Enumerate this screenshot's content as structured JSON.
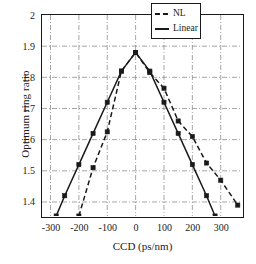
{
  "chart_data": {
    "type": "line",
    "title": "",
    "xlabel": "CCD (ps/nm)",
    "ylabel": "Optimum ring ratio",
    "xlim": [
      -330,
      375
    ],
    "ylim": [
      1.355,
      2.0
    ],
    "xticks": [
      -300,
      -200,
      -100,
      0,
      100,
      200,
      300
    ],
    "xticklabels": [
      "-300",
      "-200",
      "-100",
      "0",
      "100",
      "200",
      "300"
    ],
    "yticks": [
      1.4,
      1.5,
      1.6,
      1.7,
      1.8,
      1.9,
      2.0
    ],
    "yticklabels": [
      "1.4",
      "1.5",
      "1.6",
      "1.7",
      "1.8",
      "1.9",
      "2"
    ],
    "grid": true,
    "legend_position": "upper right",
    "series": [
      {
        "name": "NL",
        "style": "dashed",
        "marker": "square",
        "color": "#1a1a1a",
        "x": [
          -200,
          -150,
          -100,
          -50,
          0,
          50,
          100,
          150,
          200,
          250,
          300,
          360
        ],
        "y": [
          1.355,
          1.51,
          1.625,
          1.82,
          1.88,
          1.815,
          1.765,
          1.66,
          1.61,
          1.525,
          1.47,
          1.39
        ]
      },
      {
        "name": "Linear",
        "style": "solid",
        "marker": "square",
        "color": "#1a1a1a",
        "x": [
          -280,
          -250,
          -200,
          -150,
          -100,
          -50,
          0,
          50,
          100,
          150,
          200,
          250,
          280
        ],
        "y": [
          1.355,
          1.42,
          1.52,
          1.62,
          1.72,
          1.82,
          1.88,
          1.82,
          1.72,
          1.62,
          1.52,
          1.42,
          1.355
        ]
      }
    ]
  },
  "legend": {
    "entries": [
      {
        "label": "NL",
        "style": "dashed"
      },
      {
        "label": "Linear",
        "style": "solid"
      }
    ]
  },
  "colors": {
    "line": "#1a1a1a",
    "grid": "#808080",
    "axis": "#1a1a1a",
    "background": "#ffffff"
  }
}
